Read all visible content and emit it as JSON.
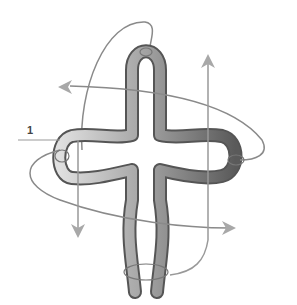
{
  "diagram": {
    "labels": [
      {
        "id": "1",
        "text": "1"
      }
    ],
    "colors": {
      "tube_outline": "#555555",
      "tube_light": "#d8d8d8",
      "tube_mid": "#9a9a9a",
      "tube_dark": "#6e6e6e",
      "thread": "#8a8a8a",
      "arrow": "#a8a8a8"
    },
    "arrows": [
      "left",
      "up",
      "down",
      "right"
    ]
  }
}
